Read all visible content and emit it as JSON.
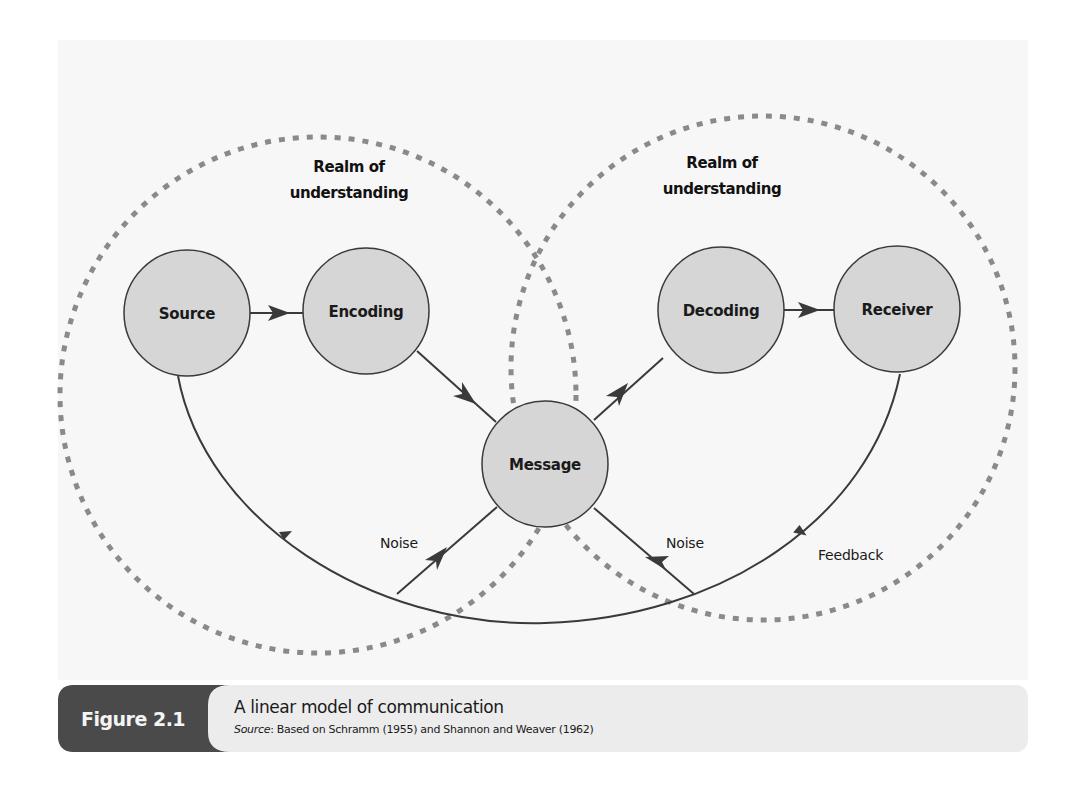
{
  "figure": {
    "number_label": "Figure 2.1",
    "title": "A linear model of communication",
    "source_prefix": "Source",
    "source_text": ": Based on Schramm (1955) and Shannon and Weaver (1962)"
  },
  "diagram": {
    "realms": [
      {
        "label_line1": "Realm of",
        "label_line2": "understanding"
      },
      {
        "label_line1": "Realm of",
        "label_line2": "understanding"
      }
    ],
    "nodes": [
      {
        "id": "source",
        "label": "Source"
      },
      {
        "id": "encoding",
        "label": "Encoding"
      },
      {
        "id": "message",
        "label": "Message"
      },
      {
        "id": "decoding",
        "label": "Decoding"
      },
      {
        "id": "receiver",
        "label": "Receiver"
      }
    ],
    "edge_labels": {
      "noise_left": "Noise",
      "noise_right": "Noise",
      "feedback": "Feedback"
    },
    "colors": {
      "node_fill": "#d6d6d6",
      "node_stroke": "#3a3a3a",
      "dashed_boundary": "#8a8a8a",
      "arrow": "#3a3a3a",
      "panel_bg": "#f7f7f7",
      "fig_tag_bg": "#4a4a4a",
      "caption_bg": "#ececec"
    }
  }
}
